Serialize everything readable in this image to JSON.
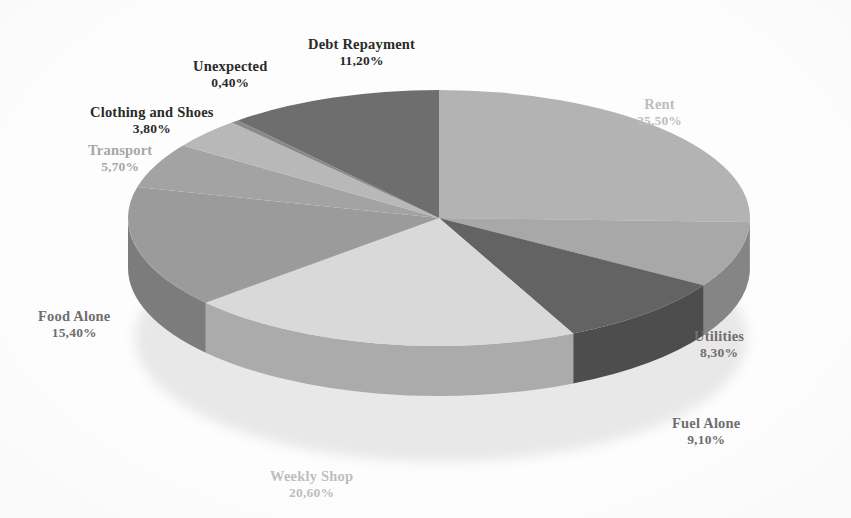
{
  "chart_data": {
    "type": "pie",
    "title": "",
    "subtitle": "",
    "xlabel": "",
    "ylabel": "",
    "legend_position": "none",
    "grid": false,
    "value_suffix": "%",
    "decimal_separator": ",",
    "start_angle_deg": 0,
    "direction": "clockwise",
    "three_d": true,
    "categories": [
      "Rent",
      "Utilities",
      "Fuel Alone",
      "Weekly Shop",
      "Food Alone",
      "Transport",
      "Clothing and Shoes",
      "Unexpected",
      "Debt Repayment"
    ],
    "values": [
      25.5,
      8.3,
      9.1,
      20.6,
      15.4,
      5.7,
      3.8,
      0.4,
      11.2
    ],
    "value_labels": [
      "25,50%",
      "8,30%",
      "9,10%",
      "20,60%",
      "15,40%",
      "5,70%",
      "3,80%",
      "0,40%",
      "11,20%"
    ],
    "slice_colors": [
      "#b3b3b3",
      "#a8a8a8",
      "#636363",
      "#d9d9d9",
      "#9b9b9b",
      "#a3a3a3",
      "#b8b8b8",
      "#8a8a8a",
      "#6e6e6e"
    ],
    "side_colors": [
      "#8e8e8e",
      "#858585",
      "#4e4e4e",
      "#ababab",
      "#7c7c7c",
      "#828282",
      "#939393",
      "#6e6e6e",
      "#565656"
    ]
  },
  "labels": [
    {
      "name": "Debt Repayment",
      "value": "11,20%",
      "tone": "tone-dark",
      "left": 308,
      "top": 36
    },
    {
      "name": "Unexpected",
      "value": "0,40%",
      "tone": "tone-dark",
      "left": 193,
      "top": 58
    },
    {
      "name": "Clothing and Shoes",
      "value": "3,80%",
      "tone": "tone-dark",
      "left": 90,
      "top": 104
    },
    {
      "name": "Transport",
      "value": "5,70%",
      "tone": "tone-light",
      "left": 88,
      "top": 142
    },
    {
      "name": "Food Alone",
      "value": "15,40%",
      "tone": "tone-mid",
      "left": 38,
      "top": 308
    },
    {
      "name": "Weekly Shop",
      "value": "20,60%",
      "tone": "tone-vlight",
      "left": 270,
      "top": 468
    },
    {
      "name": "Fuel Alone",
      "value": "9,10%",
      "tone": "tone-mid",
      "left": 672,
      "top": 415
    },
    {
      "name": "Utilities",
      "value": "8,30%",
      "tone": "tone-mid",
      "left": 694,
      "top": 328
    },
    {
      "name": "Rent",
      "value": "25,50%",
      "tone": "tone-vlight",
      "left": 637,
      "top": 96
    }
  ],
  "geometry": {
    "cx": 439,
    "cy": 218,
    "rx": 311,
    "ry": 128,
    "depth": 50
  }
}
